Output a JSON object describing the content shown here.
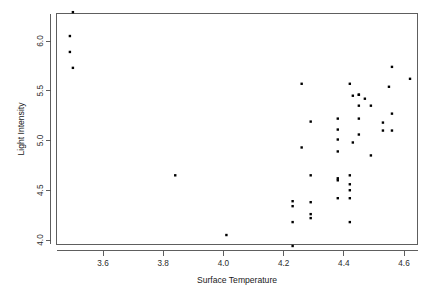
{
  "chart_data": {
    "type": "scatter",
    "title": "",
    "xlabel": "Surface Temperature",
    "ylabel": "Light Intensity",
    "xlim": [
      3.44,
      4.66
    ],
    "ylim": [
      3.9,
      6.32
    ],
    "grid": false,
    "legend": null,
    "marker": "filled-square",
    "marker_color": "#000000",
    "point_count": 47,
    "xticks": [
      "3.6",
      "3.8",
      "4.0",
      "4.2",
      "4.4",
      "4.6"
    ],
    "xtick_values": [
      3.6,
      3.8,
      4.0,
      4.2,
      4.4,
      4.6
    ],
    "yticks": [
      "4.0",
      "4.5",
      "5.0",
      "5.5",
      "6.0"
    ],
    "ytick_values": [
      4.0,
      4.5,
      5.0,
      5.5,
      6.0
    ],
    "points": [
      {
        "x": 3.5,
        "y": 6.29
      },
      {
        "x": 3.49,
        "y": 6.05
      },
      {
        "x": 3.49,
        "y": 5.89
      },
      {
        "x": 3.5,
        "y": 5.73
      },
      {
        "x": 3.84,
        "y": 4.65
      },
      {
        "x": 4.01,
        "y": 4.05
      },
      {
        "x": 4.23,
        "y": 4.39
      },
      {
        "x": 4.23,
        "y": 4.34
      },
      {
        "x": 4.23,
        "y": 4.18
      },
      {
        "x": 4.23,
        "y": 3.94
      },
      {
        "x": 4.26,
        "y": 5.57
      },
      {
        "x": 4.26,
        "y": 4.93
      },
      {
        "x": 4.29,
        "y": 5.19
      },
      {
        "x": 4.29,
        "y": 4.65
      },
      {
        "x": 4.29,
        "y": 4.38
      },
      {
        "x": 4.29,
        "y": 4.26
      },
      {
        "x": 4.29,
        "y": 4.22
      },
      {
        "x": 4.38,
        "y": 5.22
      },
      {
        "x": 4.38,
        "y": 5.11
      },
      {
        "x": 4.38,
        "y": 5.01
      },
      {
        "x": 4.38,
        "y": 4.89
      },
      {
        "x": 4.38,
        "y": 4.62
      },
      {
        "x": 4.38,
        "y": 4.6
      },
      {
        "x": 4.38,
        "y": 4.42
      },
      {
        "x": 4.42,
        "y": 5.57
      },
      {
        "x": 4.42,
        "y": 4.65
      },
      {
        "x": 4.42,
        "y": 4.56
      },
      {
        "x": 4.42,
        "y": 4.5
      },
      {
        "x": 4.42,
        "y": 4.42
      },
      {
        "x": 4.42,
        "y": 4.18
      },
      {
        "x": 4.43,
        "y": 5.45
      },
      {
        "x": 4.43,
        "y": 4.98
      },
      {
        "x": 4.45,
        "y": 5.46
      },
      {
        "x": 4.45,
        "y": 5.35
      },
      {
        "x": 4.45,
        "y": 5.22
      },
      {
        "x": 4.45,
        "y": 5.06
      },
      {
        "x": 4.47,
        "y": 5.42
      },
      {
        "x": 4.49,
        "y": 5.35
      },
      {
        "x": 4.49,
        "y": 4.85
      },
      {
        "x": 4.53,
        "y": 5.18
      },
      {
        "x": 4.53,
        "y": 5.1
      },
      {
        "x": 4.55,
        "y": 5.54
      },
      {
        "x": 4.56,
        "y": 5.74
      },
      {
        "x": 4.56,
        "y": 5.27
      },
      {
        "x": 4.56,
        "y": 5.1
      },
      {
        "x": 4.62,
        "y": 5.62
      },
      {
        "x": 4.45,
        "y": 5.46
      }
    ]
  },
  "colors": {
    "axis": "#4d4d4d",
    "text": "#1a1a1a",
    "point": "#000000",
    "background": "#ffffff"
  }
}
